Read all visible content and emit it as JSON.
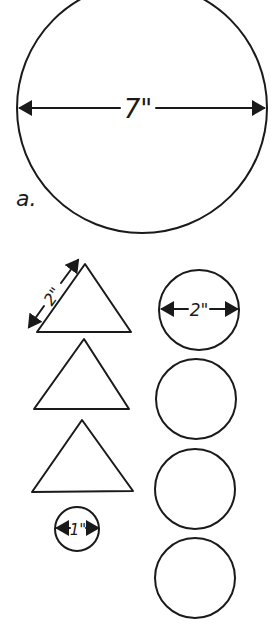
{
  "diagram": {
    "big_circle": {
      "label": "a.",
      "diameter_label": "7\""
    },
    "triangles": [
      {
        "side_label": "2\""
      },
      {
        "side_label": ""
      },
      {
        "side_label": ""
      }
    ],
    "circles_right": [
      {
        "diameter_label": "2\""
      },
      {
        "diameter_label": ""
      },
      {
        "diameter_label": ""
      },
      {
        "diameter_label": ""
      }
    ],
    "small_circle": {
      "diameter_label": "1\""
    }
  }
}
